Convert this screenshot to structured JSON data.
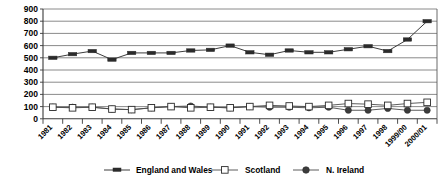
{
  "chart_data": {
    "type": "line",
    "title": "",
    "subtitle": "",
    "xlabel": "",
    "ylabel": "",
    "ylim": [
      0,
      900
    ],
    "ytick_step": 100,
    "yticks": [
      0,
      100,
      200,
      300,
      400,
      500,
      600,
      700,
      800,
      900
    ],
    "ytick_labels": [
      "0",
      "100",
      "200",
      "300",
      "400",
      "500",
      "600",
      "700",
      "800",
      "900"
    ],
    "grid": true,
    "grid_axis": "y",
    "legend_position": "bottom",
    "categories": [
      "1981",
      "1982",
      "1983",
      "1984",
      "1985",
      "1986",
      "1987",
      "1988",
      "1989",
      "1990",
      "1991",
      "1992",
      "1993",
      "1994",
      "1995",
      "1996",
      "1997",
      "1998",
      "1999/00",
      "2000/01"
    ],
    "series": [
      {
        "name": "England and Wales",
        "marker": "filled-rectangle",
        "color": "#2b2b2b",
        "values": [
          500,
          530,
          555,
          485,
          540,
          540,
          540,
          560,
          565,
          600,
          545,
          525,
          560,
          545,
          545,
          570,
          595,
          555,
          545,
          545
        ]
      },
      {
        "name": "Scotland",
        "marker": "open-square",
        "color": "#2b2b2b",
        "values": [
          95,
          90,
          95,
          80,
          75,
          90,
          100,
          90,
          95,
          90,
          100,
          110,
          105,
          100,
          110,
          125,
          120,
          110,
          125,
          135
        ]
      },
      {
        "name": "N. Ireland",
        "marker": "filled-circle",
        "color": "#3c3c3c",
        "values": [
          95,
          95,
          95,
          80,
          75,
          90,
          100,
          105,
          95,
          90,
          100,
          95,
          95,
          90,
          95,
          70,
          70,
          85,
          70,
          70
        ]
      }
    ],
    "series2_tail": {
      "note": "England and Wales rises steeply after 1998",
      "values": [
        555,
        650,
        800
      ]
    }
  },
  "legend": {
    "items": [
      {
        "label": "England and Wales",
        "marker": "filled-rectangle"
      },
      {
        "label": "Scotland",
        "marker": "open-square"
      },
      {
        "label": "N. Ireland",
        "marker": "filled-circle"
      }
    ]
  },
  "colors": {
    "grid": "#7d7d7d",
    "axis": "#3a3a3a",
    "series_ew": "#2b2b2b",
    "series_scotland": "#2b2b2b",
    "series_nireland": "#3c3c3c",
    "background": "#ffffff"
  }
}
